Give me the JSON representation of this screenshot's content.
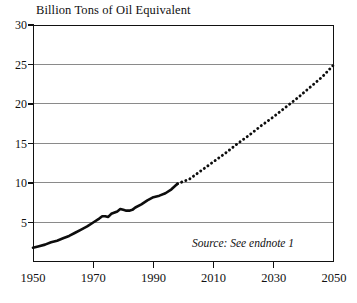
{
  "chart_data": {
    "type": "line",
    "title": "Billion Tons of Oil Equivalent",
    "xlabel": "",
    "ylabel": "",
    "xlim": [
      1950,
      2050
    ],
    "ylim": [
      0,
      30
    ],
    "grid": true,
    "legend_position": "none",
    "ytick_labels": [
      "30",
      "25",
      "20",
      "15",
      "10",
      "5"
    ],
    "ytick_values": [
      30,
      25,
      20,
      15,
      10,
      5
    ],
    "xtick_labels": [
      "1950",
      "1970",
      "1990",
      "2010",
      "2030",
      "2050"
    ],
    "xtick_values": [
      1950,
      1970,
      1990,
      2010,
      2030,
      2050
    ],
    "annotations": [
      {
        "name": "source-note",
        "text": "Source: See endnote 1",
        "style": "italic"
      }
    ],
    "series": [
      {
        "name": "World Energy Use (historical)",
        "style": "solid",
        "x": [
          1950,
          1952,
          1954,
          1956,
          1958,
          1960,
          1962,
          1964,
          1966,
          1968,
          1970,
          1972,
          1973,
          1974,
          1975,
          1976,
          1978,
          1979,
          1980,
          1981,
          1982,
          1983,
          1984,
          1986,
          1988,
          1990,
          1992,
          1994,
          1996,
          1998
        ],
        "y": [
          1.8,
          2.0,
          2.2,
          2.5,
          2.7,
          3.0,
          3.3,
          3.7,
          4.1,
          4.5,
          5.0,
          5.5,
          5.8,
          5.8,
          5.7,
          6.1,
          6.4,
          6.7,
          6.6,
          6.5,
          6.5,
          6.6,
          6.9,
          7.3,
          7.8,
          8.2,
          8.4,
          8.7,
          9.2,
          9.9
        ]
      },
      {
        "name": "World Energy Use (projected)",
        "style": "dotted",
        "x": [
          1998,
          2002,
          2006,
          2010,
          2014,
          2018,
          2022,
          2026,
          2030,
          2034,
          2038,
          2042,
          2046,
          2050
        ],
        "y": [
          9.9,
          10.5,
          11.6,
          12.7,
          13.8,
          15.0,
          16.1,
          17.3,
          18.4,
          19.6,
          20.8,
          22.1,
          23.4,
          25.0
        ]
      }
    ]
  },
  "colors": {
    "line": "#0d0d0d",
    "grid": "#8a8a8a",
    "frame": "#111111",
    "background": "#ffffff"
  }
}
